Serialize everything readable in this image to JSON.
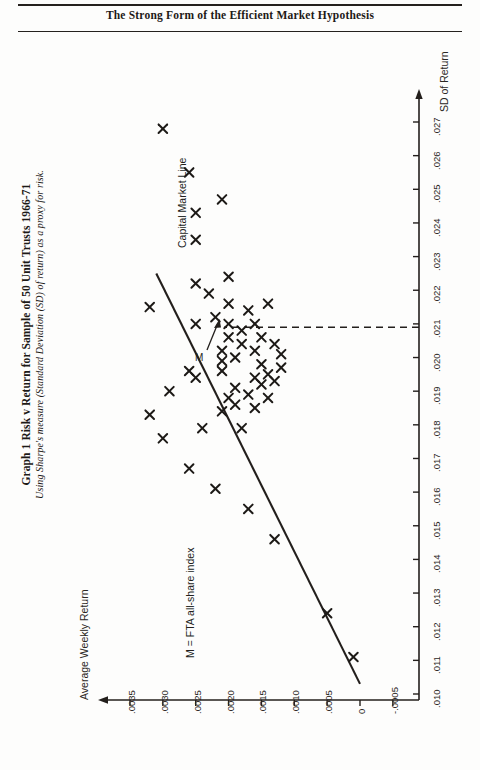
{
  "page": {
    "running_head": "The Strong Form of the Efficient Market Hypothesis"
  },
  "figure": {
    "title": "Graph 1 Risk v Return for Sample of 50 Unit Trusts 1966-71",
    "subtitle": "Using Sharpe's measure (Standard Deviation (SD) of return) as a proxy for risk.",
    "annotations": {
      "capital_market_line": "Capital Market Line",
      "market_point": "M",
      "market_legend": "M = FTA all-share index"
    }
  },
  "chart_data": {
    "type": "scatter",
    "title": "Graph 1 Risk v Return for Sample of 50 Unit Trusts 1966-71",
    "subtitle": "Using Sharpe's measure (Standard Deviation (SD) of return) as a proxy for risk.",
    "xlabel": "SD of Return",
    "ylabel": "Average Weekly Return",
    "orientation": "rotated-90",
    "grid": false,
    "legend_position": "none",
    "xlim": [
      0.0095,
      0.0278
    ],
    "ylim": [
      -0.0007,
      0.0038
    ],
    "xticks": [
      ".010",
      ".011",
      ".012",
      ".013",
      ".014",
      ".015",
      ".016",
      ".017",
      ".018",
      ".019",
      ".020",
      ".021",
      ".022",
      ".023",
      ".024",
      ".025",
      ".026",
      ".027"
    ],
    "xtick_values": [
      0.01,
      0.011,
      0.012,
      0.013,
      0.014,
      0.015,
      0.016,
      0.017,
      0.018,
      0.019,
      0.02,
      0.021,
      0.022,
      0.023,
      0.024,
      0.025,
      0.026,
      0.027
    ],
    "yticks": [
      ".0035",
      ".0030",
      ".0025",
      ".0020",
      ".0015",
      ".0010",
      ".0005",
      "0",
      "-.0005"
    ],
    "ytick_values": [
      0.0035,
      0.003,
      0.0025,
      0.002,
      0.0015,
      0.001,
      0.0005,
      0.0,
      -0.0005
    ],
    "marker": "x",
    "series": [
      {
        "name": "50 Unit Trusts",
        "points": [
          [
            0.0215,
            0.0032
          ],
          [
            0.0268,
            0.003
          ],
          [
            0.0255,
            0.0026
          ],
          [
            0.0235,
            0.0025
          ],
          [
            0.0222,
            0.0025
          ],
          [
            0.0212,
            0.0022
          ],
          [
            0.0199,
            0.0021
          ],
          [
            0.0247,
            0.0021
          ],
          [
            0.019,
            0.0029
          ],
          [
            0.0196,
            0.0026
          ],
          [
            0.0194,
            0.0025
          ],
          [
            0.021,
            0.0025
          ],
          [
            0.0219,
            0.0023
          ],
          [
            0.0243,
            0.0025
          ],
          [
            0.0183,
            0.0032
          ],
          [
            0.0202,
            0.0021
          ],
          [
            0.0206,
            0.002
          ],
          [
            0.021,
            0.002
          ],
          [
            0.0216,
            0.002
          ],
          [
            0.0224,
            0.002
          ],
          [
            0.0204,
            0.0018
          ],
          [
            0.0208,
            0.0018
          ],
          [
            0.0176,
            0.003
          ],
          [
            0.0179,
            0.0018
          ],
          [
            0.0196,
            0.0021
          ],
          [
            0.02,
            0.0019
          ],
          [
            0.0194,
            0.0016
          ],
          [
            0.0198,
            0.0015
          ],
          [
            0.0202,
            0.0016
          ],
          [
            0.0206,
            0.0015
          ],
          [
            0.0195,
            0.0014
          ],
          [
            0.0192,
            0.0015
          ],
          [
            0.0189,
            0.0017
          ],
          [
            0.0186,
            0.0019
          ],
          [
            0.0191,
            0.0019
          ],
          [
            0.0188,
            0.002
          ],
          [
            0.0184,
            0.0021
          ],
          [
            0.0193,
            0.0013
          ],
          [
            0.0197,
            0.0012
          ],
          [
            0.0201,
            0.0012
          ],
          [
            0.0188,
            0.0014
          ],
          [
            0.0185,
            0.0016
          ],
          [
            0.0216,
            0.0014
          ],
          [
            0.0214,
            0.0017
          ],
          [
            0.021,
            0.0016
          ],
          [
            0.0204,
            0.0013
          ],
          [
            0.0179,
            0.0024
          ],
          [
            0.0167,
            0.0026
          ],
          [
            0.0161,
            0.0022
          ],
          [
            0.0155,
            0.0017
          ],
          [
            0.0146,
            0.0013
          ],
          [
            0.0124,
            0.0005
          ],
          [
            0.0111,
            0.0001
          ]
        ]
      }
    ],
    "reference_lines": [
      {
        "name": "Capital Market Line",
        "type": "line",
        "from": [
          0.0103,
          0.0
        ],
        "to": [
          0.0225,
          0.0031
        ]
      },
      {
        "name": "market-sd-guide",
        "type": "dashed",
        "from": [
          0.0196,
          0.0019
        ],
        "to": [
          0.021,
          0.0019
        ]
      }
    ],
    "annotations": [
      {
        "text": "Capital Market Line",
        "anchor": [
          0.0222,
          0.003
        ]
      },
      {
        "text": "M",
        "anchor": [
          0.0197,
          0.0016
        ]
      },
      {
        "text": "M = FTA all-share index",
        "anchor": [
          0.014,
          0.0016
        ]
      }
    ]
  }
}
